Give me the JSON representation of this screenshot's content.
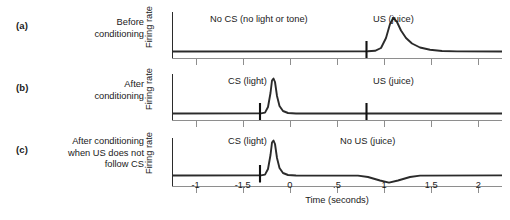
{
  "figure": {
    "xaxis_title": "Time (seconds)",
    "yaxis_label": "Firing rate"
  },
  "panels": [
    {
      "tag": "(a)",
      "caption": "Before\nconditioning",
      "annotations": [
        {
          "name": "no-cs-annotation",
          "text": "No CS (no light or tone)",
          "x": 0.1
        },
        {
          "name": "us-annotation",
          "text": "US (juice)",
          "x": 0.675
        }
      ]
    },
    {
      "tag": "(b)",
      "caption": "After\nconditioning",
      "annotations": [
        {
          "name": "cs-annotation",
          "text": "CS (light)",
          "x": 0.205
        },
        {
          "name": "us-annotation",
          "text": "US (juice)",
          "x": 0.675
        }
      ]
    },
    {
      "tag": "(c)",
      "caption": "After conditioning\nwhen US does not\nfollow CS",
      "annotations": [
        {
          "name": "cs-annotation",
          "text": "CS (light)",
          "x": 0.205
        },
        {
          "name": "no-us-annotation",
          "text": "No US (juice)",
          "x": 0.545
        }
      ]
    }
  ],
  "chart_data": {
    "type": "line",
    "xlabel": "Time (seconds)",
    "ylabel": "Firing rate",
    "xlim": [
      -1.25,
      2.25
    ],
    "grid": false,
    "legend": "none",
    "xticks": [
      -1,
      -0.5,
      0,
      0.5,
      1,
      1.5,
      2
    ],
    "xticklabels": [
      "-1",
      "-1.5",
      "0",
      ".5",
      "1",
      "1.5",
      "2"
    ],
    "series": [
      {
        "name": "(a) Before conditioning",
        "panel": "a",
        "event_markers": [
          {
            "label": "US (juice)",
            "t": 1.2
          }
        ],
        "description": "Flat baseline with a large phasic burst following the unexpected US at 1.2 s; peak at about 1.4 s decaying back to baseline by 2.0 s.",
        "baseline": 0.0,
        "peak_time": 1.4,
        "peak_amplitude": 1.0,
        "x": [
          -1.25,
          0.0,
          0.6,
          1.2,
          1.28,
          1.36,
          1.42,
          1.5,
          1.6,
          1.75,
          1.95,
          2.25
        ],
        "y": [
          0.02,
          0.02,
          0.02,
          0.03,
          0.18,
          0.72,
          1.0,
          0.62,
          0.34,
          0.14,
          0.04,
          0.02
        ]
      },
      {
        "name": "(b) After conditioning",
        "panel": "b",
        "event_markers": [
          {
            "label": "CS (light)",
            "t": 0.0
          },
          {
            "label": "US (juice)",
            "t": 1.2
          }
        ],
        "description": "Sharp narrow burst just after the conditioned stimulus at 0 s; no response remains to the now fully predicted US at 1.2 s.",
        "baseline": 0.0,
        "peak_time": 0.12,
        "peak_amplitude": 1.0,
        "x": [
          -1.25,
          -0.05,
          0.05,
          0.1,
          0.13,
          0.18,
          0.26,
          0.4,
          1.2,
          2.25
        ],
        "y": [
          0.02,
          0.02,
          0.16,
          0.78,
          1.0,
          0.46,
          0.12,
          0.03,
          0.02,
          0.02
        ]
      },
      {
        "name": "(c) After conditioning when US does not follow CS",
        "panel": "c",
        "event_markers": [
          {
            "label": "CS (light)",
            "t": 0.0
          },
          {
            "label": "No US (juice)",
            "t": 1.2
          }
        ],
        "description": "Sharp burst to the conditioned stimulus at 0 s, followed by a depression of firing below baseline around the time the omitted reward was expected, with a trough near 1.5 s.",
        "baseline": 0.0,
        "peak_time": 0.12,
        "peak_amplitude": 1.0,
        "trough_time": 1.5,
        "trough_amplitude": -0.22,
        "x": [
          -1.25,
          -0.05,
          0.05,
          0.1,
          0.13,
          0.18,
          0.26,
          0.4,
          1.1,
          1.28,
          1.5,
          1.68,
          1.85,
          2.25
        ],
        "y": [
          0.02,
          0.02,
          0.16,
          0.78,
          1.0,
          0.46,
          0.12,
          0.03,
          0.02,
          -0.1,
          -0.22,
          -0.1,
          0.02,
          0.02
        ]
      }
    ]
  }
}
